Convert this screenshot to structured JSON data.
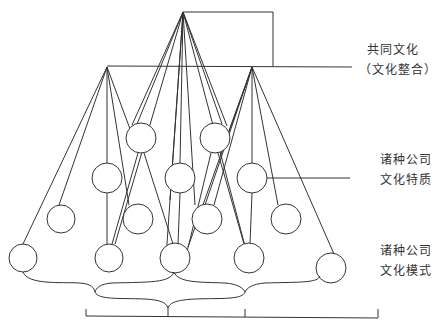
{
  "diagram": {
    "labels": {
      "common_culture": {
        "line1": "共同文化",
        "line2": "（文化整合）"
      },
      "company_culture_traits": {
        "line1": "诸种公司",
        "line2": "文化特质"
      },
      "company_culture_patterns": {
        "line1": "诸种公司",
        "line2": "文化模式"
      }
    },
    "colors": {
      "stroke": "#333333",
      "background": "#ffffff"
    }
  }
}
